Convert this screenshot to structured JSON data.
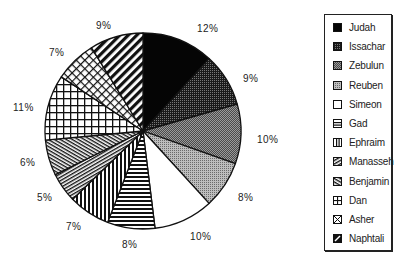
{
  "chart_data": {
    "type": "pie",
    "title": "",
    "start_angle_deg": 0,
    "direction": "clockwise",
    "legend_position": "right",
    "slices": [
      {
        "label": "Judah",
        "value": 12,
        "display": "12%",
        "pattern": "solid-black"
      },
      {
        "label": "Issachar",
        "value": 9,
        "display": "9%",
        "pattern": "dark-dots"
      },
      {
        "label": "Zebulun",
        "value": 10,
        "display": "10%",
        "pattern": "medium-gray"
      },
      {
        "label": "Reuben",
        "value": 8,
        "display": "8%",
        "pattern": "light-gray"
      },
      {
        "label": "Simeon",
        "value": 10,
        "display": "10%",
        "pattern": "white"
      },
      {
        "label": "Gad",
        "value": 8,
        "display": "8%",
        "pattern": "horizontal-lines"
      },
      {
        "label": "Ephraim",
        "value": 7,
        "display": "7%",
        "pattern": "vertical-lines"
      },
      {
        "label": "Manasseh",
        "value": 5,
        "display": "5%",
        "pattern": "diagonal-back"
      },
      {
        "label": "Benjamin",
        "value": 6,
        "display": "6%",
        "pattern": "diagonal-forward"
      },
      {
        "label": "Dan",
        "value": 11,
        "display": "11%",
        "pattern": "grid"
      },
      {
        "label": "Asher",
        "value": 7,
        "display": "7%",
        "pattern": "diag-crosshatch"
      },
      {
        "label": "Naphtali",
        "value": 9,
        "display": "9%",
        "pattern": "wide-diagonal"
      }
    ]
  },
  "legend": {
    "items": [
      {
        "label": "Judah"
      },
      {
        "label": "Issachar"
      },
      {
        "label": "Zebulun"
      },
      {
        "label": "Reuben"
      },
      {
        "label": "Simeon"
      },
      {
        "label": "Gad"
      },
      {
        "label": "Ephraim"
      },
      {
        "label": "Manasseh"
      },
      {
        "label": "Benjamin"
      },
      {
        "label": "Dan"
      },
      {
        "label": "Asher"
      },
      {
        "label": "Naphtali"
      }
    ]
  },
  "labels": [
    {
      "text": "12%",
      "x": 197,
      "y": 32
    },
    {
      "text": "9%",
      "x": 243,
      "y": 82
    },
    {
      "text": "10%",
      "x": 257,
      "y": 143
    },
    {
      "text": "8%",
      "x": 238,
      "y": 201
    },
    {
      "text": "10%",
      "x": 190,
      "y": 240
    },
    {
      "text": "8%",
      "x": 122,
      "y": 248
    },
    {
      "text": "7%",
      "x": 66,
      "y": 230
    },
    {
      "text": "5%",
      "x": 37,
      "y": 201
    },
    {
      "text": "6%",
      "x": 20,
      "y": 166
    },
    {
      "text": "11%",
      "x": 13,
      "y": 111
    },
    {
      "text": "7%",
      "x": 49,
      "y": 56
    },
    {
      "text": "9%",
      "x": 96,
      "y": 29
    }
  ]
}
